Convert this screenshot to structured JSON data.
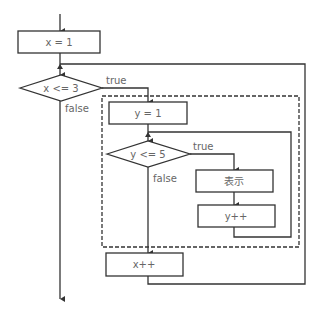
{
  "diagram": {
    "type": "flowchart",
    "nodes": {
      "init_x": {
        "label": "x = 1",
        "shape": "process"
      },
      "cond_x": {
        "label": "x <= 3",
        "shape": "decision"
      },
      "init_y": {
        "label": "y = 1",
        "shape": "process"
      },
      "cond_y": {
        "label": "y <= 5",
        "shape": "decision"
      },
      "display": {
        "label": "表示",
        "shape": "process"
      },
      "inc_y": {
        "label": "y++",
        "shape": "process"
      },
      "inc_x": {
        "label": "x++",
        "shape": "process"
      }
    },
    "edge_labels": {
      "cond_x_true": "true",
      "cond_x_false": "false",
      "cond_y_true": "true",
      "cond_y_false": "false"
    },
    "colors": {
      "line": "#333333",
      "text": "#666666",
      "background": "#ffffff"
    }
  }
}
